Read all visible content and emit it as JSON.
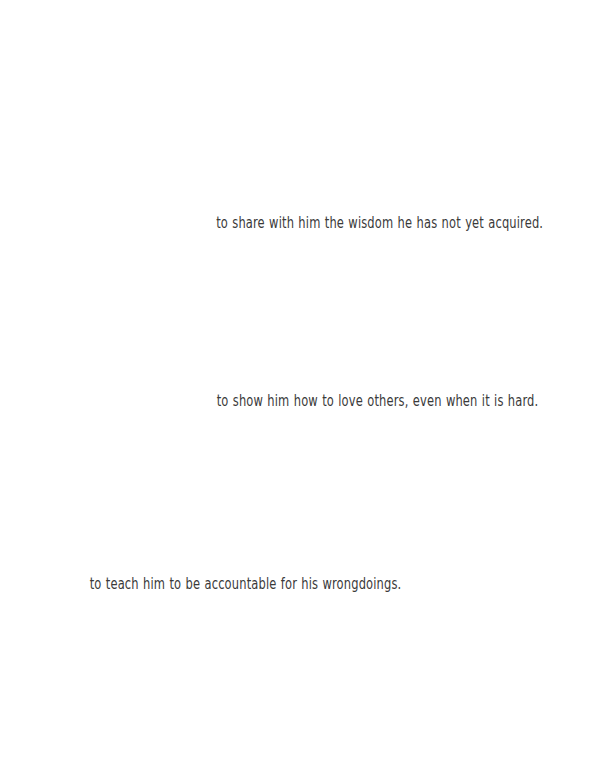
{
  "page": {
    "kind": "scanned-book-page",
    "width": 590,
    "height": 763,
    "background_color": "#ffffff",
    "ink_color": "#3a3a3a"
  },
  "body_text": {
    "lines": [
      {
        "text": "to share with him the wisdom he has not yet acquired.",
        "align": "centered-right-of-page"
      },
      {
        "text": "to show him how to love others, even when it is hard.",
        "align": "centered-right-of-page"
      },
      {
        "text": "to teach him to be accountable for his wrongdoings.",
        "align": "left-of-page"
      }
    ]
  }
}
